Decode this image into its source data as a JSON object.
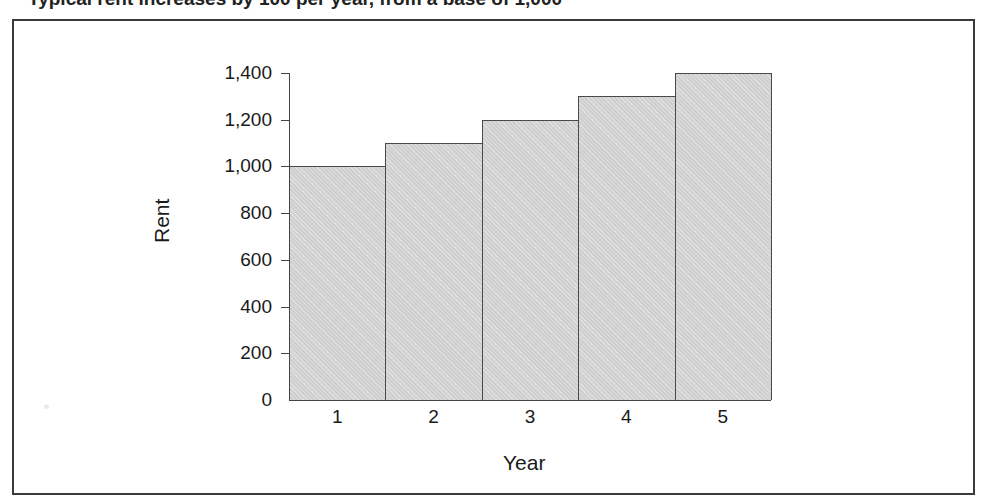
{
  "page": {
    "title_fragment": "Typical rent increases by 100 per year, from a base of 1,000"
  },
  "chart_data": {
    "type": "bar",
    "title": "",
    "xlabel": "Year",
    "ylabel": "Rent",
    "categories": [
      "1",
      "2",
      "3",
      "4",
      "5"
    ],
    "values": [
      1000,
      1100,
      1200,
      1300,
      1400
    ],
    "ylim": [
      0,
      1400
    ],
    "yticks": [
      0,
      200,
      400,
      600,
      800,
      1000,
      1200,
      1400
    ],
    "ytick_labels": [
      "0",
      "200",
      "400",
      "600",
      "800",
      "1,000",
      "1,200",
      "1,400"
    ],
    "grid": false,
    "legend": null,
    "bar_color": "#cfcfcf",
    "bar_edge_color": "#4a4a4a"
  }
}
